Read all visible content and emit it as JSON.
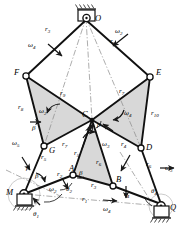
{
  "diagram": {
    "colors": {
      "stroke": "#1a1a1a",
      "fill_shade": "#d9d9d9",
      "fill_shade2": "#cfcfcf",
      "ground_hatch": "#333333",
      "background": "#ffffff",
      "dashdot": "#777777"
    },
    "joints": [
      {
        "id": "O",
        "label": "O",
        "x": 86,
        "y": 18,
        "type": "ground-pivot"
      },
      {
        "id": "F",
        "label": "F",
        "x": 26,
        "y": 76,
        "type": "pin"
      },
      {
        "id": "E",
        "label": "E",
        "x": 150,
        "y": 77,
        "type": "pin"
      },
      {
        "id": "C",
        "label": "C",
        "x": 92,
        "y": 120,
        "type": "pin"
      },
      {
        "id": "G",
        "label": "G",
        "x": 44,
        "y": 146,
        "type": "pin"
      },
      {
        "id": "D",
        "label": "D",
        "x": 141,
        "y": 148,
        "type": "pin"
      },
      {
        "id": "A",
        "label": "A",
        "x": 73,
        "y": 175,
        "type": "pin"
      },
      {
        "id": "B",
        "label": "B",
        "x": 113,
        "y": 186,
        "type": "pin"
      },
      {
        "id": "M",
        "label": "M",
        "x": 24,
        "y": 194,
        "type": "ground-pivot"
      },
      {
        "id": "Q",
        "label": "Q",
        "x": 161,
        "y": 206,
        "type": "ground-pivot"
      }
    ],
    "links": [
      {
        "name": "O-F",
        "label": "r3"
      },
      {
        "name": "O-E",
        "label": "r9"
      },
      {
        "name": "F-G",
        "label": "r8"
      },
      {
        "name": "F-C",
        "label": "r9"
      },
      {
        "name": "C-E",
        "label": "r7"
      },
      {
        "name": "E-D",
        "label": "r10"
      },
      {
        "name": "C-G",
        "label": "r7"
      },
      {
        "name": "C-D",
        "label": "r4"
      },
      {
        "name": "G-M",
        "label": "r5"
      },
      {
        "name": "D-Q",
        "label": "r6"
      },
      {
        "name": "M-A",
        "label": "r2"
      },
      {
        "name": "A-C",
        "label": "r5"
      },
      {
        "name": "A-B",
        "label": "r3"
      },
      {
        "name": "C-B",
        "label": "r6"
      },
      {
        "name": "B-Q",
        "label": "r4"
      },
      {
        "name": "M-Q",
        "label": "r1"
      }
    ],
    "labels": [
      {
        "name": "joint-O",
        "text": "O",
        "x": 95,
        "y": 14,
        "kind": "node"
      },
      {
        "name": "joint-F",
        "text": "F",
        "x": 15,
        "y": 70,
        "kind": "node"
      },
      {
        "name": "joint-E",
        "text": "E",
        "x": 157,
        "y": 70,
        "kind": "node"
      },
      {
        "name": "joint-C",
        "text": "C",
        "x": 85,
        "y": 110,
        "kind": "node"
      },
      {
        "name": "joint-G",
        "text": "G",
        "x": 49,
        "y": 148,
        "kind": "node"
      },
      {
        "name": "joint-D",
        "text": "D",
        "x": 146,
        "y": 145,
        "kind": "node"
      },
      {
        "name": "joint-A",
        "text": "A",
        "x": 70,
        "y": 166,
        "kind": "node"
      },
      {
        "name": "joint-B",
        "text": "B",
        "x": 116,
        "y": 177,
        "kind": "node"
      },
      {
        "name": "joint-M",
        "text": "M",
        "x": 8,
        "y": 190,
        "kind": "node"
      },
      {
        "name": "joint-Q",
        "text": "Q",
        "x": 168,
        "y": 206,
        "kind": "node"
      }
    ],
    "link_labels": [
      {
        "name": "r3-label",
        "base": "r",
        "sub": "3",
        "x": 46,
        "y": 28
      },
      {
        "name": "r9-top-label",
        "base": "r",
        "sub": "9",
        "x": 110,
        "y": 38
      },
      {
        "name": "r8-label",
        "base": "r",
        "sub": "8",
        "x": 19,
        "y": 106
      },
      {
        "name": "r9-label",
        "base": "r",
        "sub": "9",
        "x": 62,
        "y": 93
      },
      {
        "name": "r7-label",
        "base": "r",
        "sub": "7",
        "x": 120,
        "y": 90
      },
      {
        "name": "r10-label",
        "base": "r",
        "sub": "10",
        "x": 152,
        "y": 113
      },
      {
        "name": "r7-lower-label",
        "base": "r",
        "sub": "7",
        "x": 63,
        "y": 143
      },
      {
        "name": "r4-label",
        "base": "r",
        "sub": "4",
        "x": 122,
        "y": 143
      },
      {
        "name": "r5-left-label",
        "base": "r",
        "sub": "5",
        "x": 42,
        "y": 155
      },
      {
        "name": "r6-right-label",
        "base": "r",
        "sub": "6",
        "x": 147,
        "y": 163
      },
      {
        "name": "r2-label",
        "base": "r",
        "sub": "2",
        "x": 58,
        "y": 173
      },
      {
        "name": "r5-label",
        "base": "r",
        "sub": "5",
        "x": 75,
        "y": 152
      },
      {
        "name": "r6-label",
        "base": "r",
        "sub": "6",
        "x": 97,
        "y": 161
      },
      {
        "name": "r3-lower-label",
        "base": "r",
        "sub": "3",
        "x": 92,
        "y": 184
      },
      {
        "name": "r4-lower-label",
        "base": "r",
        "sub": "4",
        "x": 125,
        "y": 193
      },
      {
        "name": "r1-label",
        "base": "r",
        "sub": "1",
        "x": 83,
        "y": 198
      }
    ],
    "omega_labels": [
      {
        "name": "omega2-top-label",
        "base": "ω",
        "sub": "2",
        "x": 115,
        "y": 30
      },
      {
        "name": "omega4-top-label",
        "base": "ω",
        "sub": "4",
        "x": 29,
        "y": 44
      },
      {
        "name": "omega2-left-label",
        "base": "ω",
        "sub": "2",
        "x": 40,
        "y": 110
      },
      {
        "name": "omega4-right-label",
        "base": "ω",
        "sub": "4",
        "x": 125,
        "y": 112
      },
      {
        "name": "omega3-center-label",
        "base": "ω",
        "sub": "3",
        "x": 103,
        "y": 143
      },
      {
        "name": "omega5-left-label",
        "base": "ω",
        "sub": "5",
        "x": 13,
        "y": 142
      },
      {
        "name": "omega3-right-label",
        "base": "ω",
        "sub": "3",
        "x": 165,
        "y": 167
      },
      {
        "name": "omega2-bottom-label",
        "base": "ω",
        "sub": "2",
        "x": 50,
        "y": 188
      },
      {
        "name": "omega4-bottom-label",
        "base": "ω",
        "sub": "4",
        "x": 104,
        "y": 208
      }
    ],
    "angle_labels": [
      {
        "name": "beta-F-label",
        "base": "β",
        "sub": "",
        "x": 33,
        "y": 127
      },
      {
        "name": "beta-C-label",
        "base": "β",
        "sub": "",
        "x": 98,
        "y": 124
      },
      {
        "name": "beta-G-label",
        "base": "β",
        "sub": "",
        "x": 27,
        "y": 167
      },
      {
        "name": "beta-M-label",
        "base": "β",
        "sub": "",
        "x": 36,
        "y": 175
      },
      {
        "name": "beta-A-label",
        "base": "β",
        "sub": "",
        "x": 80,
        "y": 172
      },
      {
        "name": "theta1-label",
        "base": "θ",
        "sub": "1",
        "x": 34,
        "y": 213
      },
      {
        "name": "theta2-label",
        "base": "θ",
        "sub": "2",
        "x": 67,
        "y": 188
      },
      {
        "name": "theta4-label",
        "base": "θ",
        "sub": "4",
        "x": 152,
        "y": 190
      }
    ]
  }
}
